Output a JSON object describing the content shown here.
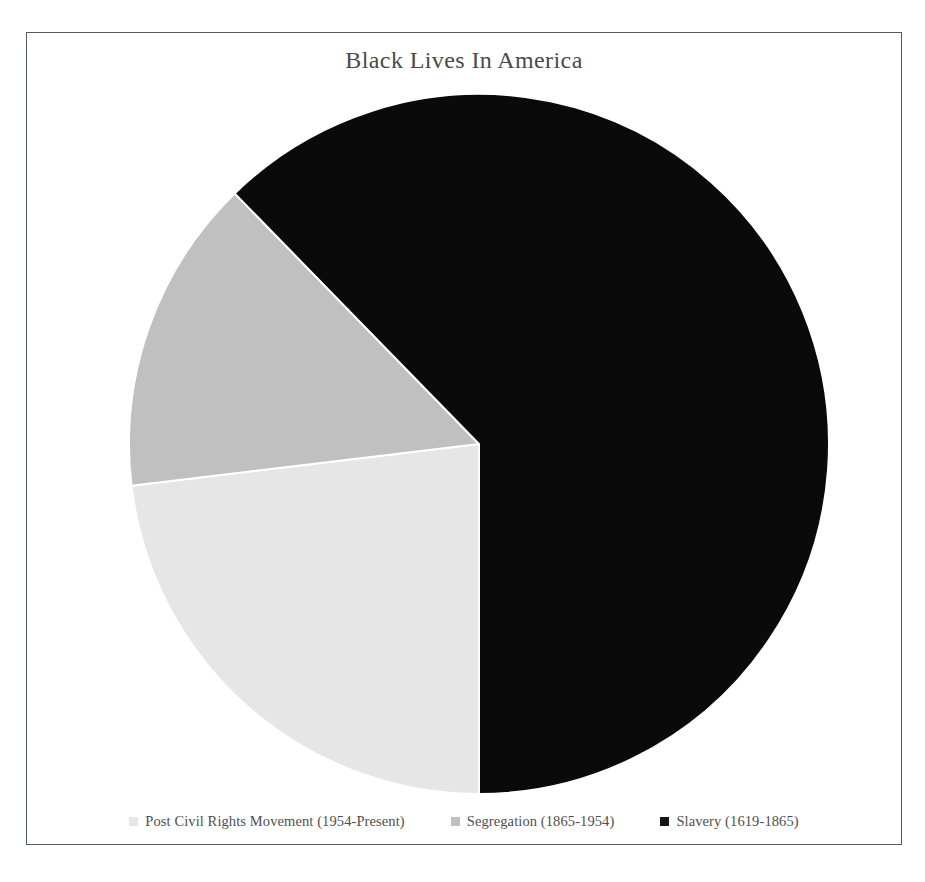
{
  "chart_data": {
    "type": "pie",
    "title": "Black Lives In America",
    "xlabel": "",
    "ylabel": "",
    "legend_position": "bottom",
    "grid": false,
    "start_angle_deg": 180,
    "direction": "clockwise",
    "categories": [
      "Post Civil Rights Movement (1954-Present)",
      "Segregation (1865-1954)",
      "Slavery (1619-1865)"
    ],
    "values": [
      23.1,
      14.6,
      62.3
    ],
    "units": "percent",
    "colors": [
      "#e6e6e6",
      "#c0c0c0",
      "#0a0a0a"
    ],
    "slices": [
      {
        "label": "Post Civil Rights Movement (1954-Present)",
        "period_start": 1954,
        "period_end": "Present",
        "value": 23.1,
        "sweep_deg": 83.2,
        "color": "#e6e6e6"
      },
      {
        "label": "Segregation (1865-1954)",
        "period_start": 1865,
        "period_end": 1954,
        "value": 14.6,
        "sweep_deg": 52.4,
        "color": "#c0c0c0"
      },
      {
        "label": "Slavery (1619-1865)",
        "period_start": 1619,
        "period_end": 1865,
        "value": 62.3,
        "sweep_deg": 224.4,
        "color": "#0a0a0a"
      }
    ]
  },
  "chart": {
    "title": "Black Lives In America",
    "legend": [
      {
        "label": "Post Civil Rights Movement (1954-Present)",
        "swatch_color": "#e6e6e6",
        "swatch_name": "legend-swatch-post-civil-rights"
      },
      {
        "label": "Segregation (1865-1954)",
        "swatch_color": "#c0c0c0",
        "swatch_name": "legend-swatch-segregation"
      },
      {
        "label": "Slavery (1619-1865)",
        "swatch_color": "#161616",
        "swatch_name": "legend-swatch-slavery"
      }
    ],
    "geometry": {
      "center_x": 452,
      "center_y": 411,
      "radius": 350
    },
    "colors": {
      "frame_border": "#555a5d",
      "background": "#ffffff",
      "title_text": "#4a4a4a",
      "legend_text": "#4f4f4f",
      "slice_divider": "#ffffff"
    }
  }
}
